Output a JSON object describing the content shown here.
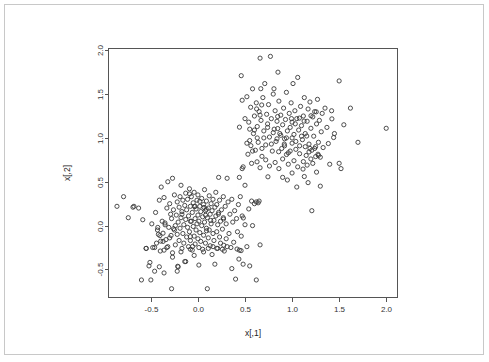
{
  "window": {
    "background_color": "#ffffff",
    "frame_color": "#c8c8c8"
  },
  "chart_data": {
    "type": "scatter",
    "title": "",
    "xlabel": "x[,1]",
    "ylabel": "x[,2]",
    "xlim": [
      -0.95,
      2.12
    ],
    "ylim": [
      -0.82,
      2.02
    ],
    "xticks": [
      -0.5,
      0.0,
      0.5,
      1.0,
      1.5,
      2.0
    ],
    "xticklabels": [
      "-0.5",
      "0.0",
      "0.5",
      "1.0",
      "1.5",
      "2.0"
    ],
    "yticks": [
      -0.5,
      0.0,
      0.5,
      1.0,
      1.5,
      2.0
    ],
    "yticklabels": [
      "-0.5",
      "0.0",
      "0.5",
      "1.0",
      "1.5",
      "2.0"
    ],
    "grid": false,
    "legend": false,
    "marker": "open-circle",
    "marker_color": "#3a3a3a",
    "marker_radius_px": 2.1,
    "n_points": 400,
    "clusters": [
      {
        "name": "cluster-1",
        "center": [
          0.0,
          0.0
        ],
        "sd": [
          0.27,
          0.25
        ],
        "n": 200
      },
      {
        "name": "cluster-2",
        "center": [
          1.0,
          1.0
        ],
        "sd": [
          0.26,
          0.26
        ],
        "n": 200
      }
    ],
    "points": [
      [
        -0.86,
        0.22
      ],
      [
        -0.79,
        0.33
      ],
      [
        -0.74,
        0.09
      ],
      [
        -0.69,
        0.21
      ],
      [
        -0.68,
        0.22
      ],
      [
        -0.63,
        0.2
      ],
      [
        -0.6,
        -0.62
      ],
      [
        -0.55,
        -0.26
      ],
      [
        -0.52,
        -0.46
      ],
      [
        -0.51,
        -0.42
      ],
      [
        -0.5,
        -0.62
      ],
      [
        -0.49,
        0.02
      ],
      [
        -0.46,
        -0.25
      ],
      [
        -0.45,
        0.15
      ],
      [
        -0.44,
        -0.2
      ],
      [
        -0.43,
        -0.05
      ],
      [
        -0.42,
        -0.1
      ],
      [
        -0.41,
        0.29
      ],
      [
        -0.4,
        -0.29
      ],
      [
        -0.39,
        0.44
      ],
      [
        -0.38,
        0.05
      ],
      [
        -0.37,
        -0.18
      ],
      [
        -0.36,
        -0.28
      ],
      [
        -0.36,
        0.32
      ],
      [
        -0.35,
        0.03
      ],
      [
        -0.34,
        -0.16
      ],
      [
        -0.33,
        -0.25
      ],
      [
        -0.33,
        0.2
      ],
      [
        -0.32,
        0.5
      ],
      [
        -0.31,
        -0.02
      ],
      [
        -0.3,
        0.25
      ],
      [
        -0.3,
        -0.14
      ],
      [
        -0.29,
        0.13
      ],
      [
        -0.28,
        -0.72
      ],
      [
        -0.28,
        0.08
      ],
      [
        -0.27,
        0.54
      ],
      [
        -0.27,
        -0.31
      ],
      [
        -0.26,
        0.18
      ],
      [
        -0.25,
        -0.05
      ],
      [
        -0.25,
        0.35
      ],
      [
        -0.24,
        0.0
      ],
      [
        -0.24,
        -0.22
      ],
      [
        -0.23,
        0.12
      ],
      [
        -0.22,
        -0.1
      ],
      [
        -0.22,
        0.27
      ],
      [
        -0.21,
        -0.47
      ],
      [
        -0.21,
        0.04
      ],
      [
        -0.2,
        0.21
      ],
      [
        -0.2,
        -0.17
      ],
      [
        -0.19,
        0.33
      ],
      [
        -0.19,
        -0.03
      ],
      [
        -0.18,
        0.46
      ],
      [
        -0.18,
        0.09
      ],
      [
        -0.17,
        -0.26
      ],
      [
        -0.17,
        0.16
      ],
      [
        -0.16,
        -0.09
      ],
      [
        -0.16,
        0.29
      ],
      [
        -0.15,
        0.01
      ],
      [
        -0.15,
        -0.2
      ],
      [
        -0.14,
        0.23
      ],
      [
        -0.14,
        -0.41
      ],
      [
        -0.13,
        0.07
      ],
      [
        -0.13,
        0.37
      ],
      [
        -0.12,
        -0.13
      ],
      [
        -0.12,
        0.18
      ],
      [
        -0.11,
        -0.02
      ],
      [
        -0.11,
        0.3
      ],
      [
        -0.1,
        -0.24
      ],
      [
        -0.1,
        0.11
      ],
      [
        -0.09,
        0.42
      ],
      [
        -0.09,
        -0.07
      ],
      [
        -0.08,
        0.22
      ],
      [
        -0.08,
        -0.17
      ],
      [
        -0.07,
        0.05
      ],
      [
        -0.07,
        0.33
      ],
      [
        -0.06,
        -0.28
      ],
      [
        -0.06,
        0.15
      ],
      [
        -0.05,
        -0.01
      ],
      [
        -0.05,
        0.26
      ],
      [
        -0.04,
        -0.12
      ],
      [
        -0.04,
        0.38
      ],
      [
        -0.03,
        0.08
      ],
      [
        -0.03,
        -0.21
      ],
      [
        -0.02,
        0.19
      ],
      [
        -0.02,
        -0.05
      ],
      [
        -0.01,
        0.29
      ],
      [
        -0.01,
        0.02
      ],
      [
        0.0,
        -0.15
      ],
      [
        0.0,
        0.12
      ],
      [
        0.0,
        0.35
      ],
      [
        0.01,
        -0.25
      ],
      [
        0.01,
        0.05
      ],
      [
        0.02,
        0.22
      ],
      [
        0.02,
        -0.08
      ],
      [
        0.03,
        0.16
      ],
      [
        0.03,
        -0.18
      ],
      [
        0.04,
        0.31
      ],
      [
        0.04,
        0.0
      ],
      [
        0.05,
        -0.27
      ],
      [
        0.05,
        0.1
      ],
      [
        0.06,
        0.24
      ],
      [
        0.06,
        -0.11
      ],
      [
        0.07,
        0.41
      ],
      [
        0.07,
        0.04
      ],
      [
        0.08,
        -0.2
      ],
      [
        0.08,
        0.17
      ],
      [
        0.09,
        -0.03
      ],
      [
        0.09,
        0.28
      ],
      [
        0.1,
        -0.72
      ],
      [
        0.1,
        0.09
      ],
      [
        0.11,
        -0.14
      ],
      [
        0.11,
        0.2
      ],
      [
        0.12,
        0.34
      ],
      [
        0.12,
        -0.05
      ],
      [
        0.13,
        0.13
      ],
      [
        0.13,
        -0.23
      ],
      [
        0.14,
        0.25
      ],
      [
        0.14,
        0.02
      ],
      [
        0.15,
        -0.33
      ],
      [
        0.15,
        0.17
      ],
      [
        0.16,
        -0.09
      ],
      [
        0.16,
        0.3
      ],
      [
        0.17,
        0.06
      ],
      [
        0.17,
        -0.17
      ],
      [
        0.18,
        0.21
      ],
      [
        0.18,
        -0.44
      ],
      [
        0.19,
        0.11
      ],
      [
        0.19,
        0.38
      ],
      [
        0.2,
        -0.07
      ],
      [
        0.2,
        0.24
      ],
      [
        0.21,
        0.01
      ],
      [
        0.21,
        -0.26
      ],
      [
        0.22,
        0.15
      ],
      [
        0.22,
        0.55
      ],
      [
        0.23,
        -0.13
      ],
      [
        0.23,
        0.29
      ],
      [
        0.24,
        0.05
      ],
      [
        0.24,
        -0.2
      ],
      [
        0.25,
        0.18
      ],
      [
        0.26,
        -0.04
      ],
      [
        0.27,
        0.33
      ],
      [
        0.27,
        0.09
      ],
      [
        0.28,
        -0.29
      ],
      [
        0.29,
        0.22
      ],
      [
        0.3,
        0.02
      ],
      [
        0.3,
        -0.15
      ],
      [
        0.31,
        0.54
      ],
      [
        0.32,
        0.27
      ],
      [
        0.33,
        -0.09
      ],
      [
        0.34,
        0.13
      ],
      [
        0.35,
        -0.25
      ],
      [
        0.36,
        0.3
      ],
      [
        0.37,
        0.04
      ],
      [
        0.38,
        -0.19
      ],
      [
        0.39,
        0.17
      ],
      [
        0.4,
        -0.61
      ],
      [
        0.41,
        0.08
      ],
      [
        0.42,
        -0.07
      ],
      [
        0.43,
        0.24
      ],
      [
        0.44,
        -0.28
      ],
      [
        0.45,
        0.33
      ],
      [
        0.46,
        -0.12
      ],
      [
        0.47,
        0.11
      ],
      [
        0.48,
        -0.44
      ],
      [
        0.5,
        0.01
      ],
      [
        0.52,
        -0.24
      ],
      [
        0.54,
        0.19
      ],
      [
        0.55,
        -0.46
      ],
      [
        0.57,
        0.28
      ],
      [
        0.58,
        0.0
      ],
      [
        0.6,
        0.25
      ],
      [
        0.62,
        -0.62
      ],
      [
        0.64,
        0.26
      ],
      [
        0.66,
        -0.22
      ],
      [
        -0.55,
        -0.26
      ],
      [
        -0.48,
        -0.25
      ],
      [
        -0.46,
        -0.52
      ],
      [
        -0.41,
        -0.47
      ],
      [
        -0.36,
        -0.54
      ],
      [
        -0.32,
        -0.24
      ],
      [
        -0.27,
        -0.36
      ],
      [
        -0.22,
        -0.52
      ],
      [
        -0.18,
        -0.3
      ],
      [
        -0.13,
        -0.41
      ],
      [
        -0.08,
        -0.27
      ],
      [
        -0.04,
        -0.34
      ],
      [
        0.01,
        -0.45
      ],
      [
        0.06,
        -0.3
      ],
      [
        0.11,
        -0.26
      ],
      [
        0.16,
        -0.24
      ],
      [
        0.2,
        -0.26
      ],
      [
        0.26,
        -0.27
      ],
      [
        0.31,
        -0.24
      ],
      [
        0.36,
        -0.49
      ],
      [
        0.44,
        0.55
      ],
      [
        0.47,
        0.65
      ],
      [
        0.48,
        0.67
      ],
      [
        0.5,
        0.46
      ],
      [
        0.46,
        1.71
      ],
      [
        0.47,
        1.43
      ],
      [
        0.5,
        1.22
      ],
      [
        0.52,
        1.47
      ],
      [
        0.54,
        1.18
      ],
      [
        0.55,
        0.97
      ],
      [
        0.56,
        1.35
      ],
      [
        0.57,
        0.71
      ],
      [
        0.58,
        1.56
      ],
      [
        0.59,
        1.05
      ],
      [
        0.6,
        1.25
      ],
      [
        0.61,
        0.86
      ],
      [
        0.62,
        1.4
      ],
      [
        0.63,
        1.13
      ],
      [
        0.64,
        0.95
      ],
      [
        0.65,
        1.3
      ],
      [
        0.66,
        1.91
      ],
      [
        0.67,
        1.2
      ],
      [
        0.68,
        0.79
      ],
      [
        0.69,
        1.46
      ],
      [
        0.7,
        1.08
      ],
      [
        0.71,
        1.62
      ],
      [
        0.72,
        0.92
      ],
      [
        0.73,
        1.27
      ],
      [
        0.74,
        1.16
      ],
      [
        0.75,
        1.38
      ],
      [
        0.76,
        1.01
      ],
      [
        0.77,
        1.93
      ],
      [
        0.78,
        1.22
      ],
      [
        0.79,
        0.85
      ],
      [
        0.8,
        1.5
      ],
      [
        0.81,
        1.1
      ],
      [
        0.82,
        1.31
      ],
      [
        0.83,
        0.96
      ],
      [
        0.84,
        1.19
      ],
      [
        0.85,
        1.75
      ],
      [
        0.86,
        1.42
      ],
      [
        0.87,
        1.05
      ],
      [
        0.88,
        1.26
      ],
      [
        0.89,
        0.88
      ],
      [
        0.9,
        1.15
      ],
      [
        0.91,
        1.34
      ],
      [
        0.92,
        0.99
      ],
      [
        0.93,
        1.21
      ],
      [
        0.94,
        1.52
      ],
      [
        0.95,
        1.08
      ],
      [
        0.96,
        0.83
      ],
      [
        0.97,
        1.28
      ],
      [
        0.98,
        1.12
      ],
      [
        0.99,
        1.4
      ],
      [
        1.0,
        0.94
      ],
      [
        1.0,
        1.18
      ],
      [
        1.01,
        1.62
      ],
      [
        1.02,
        1.04
      ],
      [
        1.03,
        1.31
      ],
      [
        1.04,
        0.87
      ],
      [
        1.05,
        1.22
      ],
      [
        1.06,
        1.69
      ],
      [
        1.07,
        1.09
      ],
      [
        1.08,
        0.91
      ],
      [
        1.09,
        1.36
      ],
      [
        1.1,
        1.14
      ],
      [
        1.11,
        0.98
      ],
      [
        1.12,
        1.25
      ],
      [
        1.13,
        1.46
      ],
      [
        1.14,
        1.05
      ],
      [
        1.15,
        0.8
      ],
      [
        1.16,
        1.19
      ],
      [
        1.17,
        1.33
      ],
      [
        1.18,
        0.93
      ],
      [
        1.19,
        1.41
      ],
      [
        1.2,
        1.11
      ],
      [
        1.21,
        0.86
      ],
      [
        1.22,
        1.24
      ],
      [
        1.23,
        1.02
      ],
      [
        1.24,
        1.3
      ],
      [
        1.25,
        0.9
      ],
      [
        1.26,
        1.16
      ],
      [
        1.27,
        1.44
      ],
      [
        1.28,
        0.95
      ],
      [
        1.29,
        1.2
      ],
      [
        1.3,
        0.78
      ],
      [
        1.31,
        1.07
      ],
      [
        1.32,
        1.28
      ],
      [
        1.33,
        0.89
      ],
      [
        1.35,
        1.34
      ],
      [
        1.37,
        1.12
      ],
      [
        1.4,
        0.7
      ],
      [
        1.42,
        1.31
      ],
      [
        1.45,
        1.05
      ],
      [
        1.5,
        1.65
      ],
      [
        1.52,
        0.65
      ],
      [
        1.55,
        1.15
      ],
      [
        1.62,
        1.34
      ],
      [
        1.7,
        0.95
      ],
      [
        2.0,
        1.11
      ],
      [
        0.66,
        0.66
      ],
      [
        0.68,
        0.88
      ],
      [
        0.7,
        1.0
      ],
      [
        0.72,
        0.75
      ],
      [
        0.74,
        1.12
      ],
      [
        0.76,
        0.68
      ],
      [
        0.78,
        0.93
      ],
      [
        0.8,
        1.06
      ],
      [
        0.82,
        0.72
      ],
      [
        0.84,
        0.99
      ],
      [
        0.86,
        0.65
      ],
      [
        0.88,
        1.03
      ],
      [
        0.9,
        0.76
      ],
      [
        0.92,
        0.91
      ],
      [
        0.94,
        1.0
      ],
      [
        0.96,
        0.7
      ],
      [
        0.98,
        0.85
      ],
      [
        1.0,
        1.0
      ],
      [
        1.02,
        0.74
      ],
      [
        1.04,
        0.96
      ],
      [
        1.06,
        0.67
      ],
      [
        1.08,
        0.82
      ],
      [
        1.1,
        1.02
      ],
      [
        1.12,
        0.73
      ],
      [
        1.14,
        0.9
      ],
      [
        1.16,
        0.69
      ],
      [
        1.18,
        0.84
      ],
      [
        1.2,
        0.76
      ],
      [
        1.22,
        0.71
      ],
      [
        1.24,
        0.88
      ],
      [
        1.26,
        0.61
      ],
      [
        1.28,
        0.8
      ],
      [
        1.3,
        0.45
      ],
      [
        1.13,
        0.56
      ],
      [
        1.17,
        0.49
      ],
      [
        1.21,
        0.17
      ],
      [
        0.62,
        0.27
      ],
      [
        0.65,
        0.28
      ],
      [
        0.9,
        0.55
      ],
      [
        0.95,
        0.52
      ],
      [
        1.0,
        0.6
      ],
      [
        1.05,
        0.44
      ],
      [
        0.6,
        1.09
      ],
      [
        0.63,
        1.0
      ],
      [
        0.58,
        0.85
      ],
      [
        0.55,
        1.1
      ],
      [
        0.52,
        0.94
      ],
      [
        0.66,
        1.26
      ]
    ]
  }
}
